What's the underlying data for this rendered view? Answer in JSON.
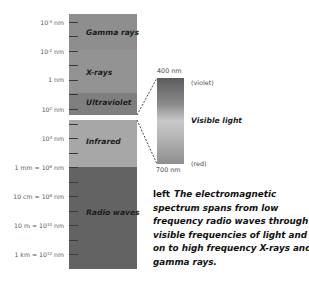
{
  "diagram": {
    "title": "Electromagnetic spectrum",
    "bands": [
      {
        "name": "Gamma rays",
        "color": "#8e8e8e"
      },
      {
        "name": "X-rays",
        "color": "#929292"
      },
      {
        "name": "Ultraviolet",
        "color": "#7e7e7e"
      },
      {
        "name": "Infrared",
        "color": "#a6a6a6"
      },
      {
        "name": "Radio waves",
        "color": "#626262"
      }
    ],
    "ticks": [
      {
        "base": "10",
        "exp": "-4",
        "unit": " nm",
        "prefix": ""
      },
      {
        "base": "10",
        "exp": "-2",
        "unit": " nm",
        "prefix": ""
      },
      {
        "base": "1",
        "exp": "",
        "unit": " nm",
        "prefix": ""
      },
      {
        "base": "10",
        "exp": "2",
        "unit": " nm",
        "prefix": ""
      },
      {
        "base": "10",
        "exp": "4",
        "unit": " nm",
        "prefix": ""
      },
      {
        "base": "10",
        "exp": "6",
        "unit": " nm",
        "prefix": "1 mm = "
      },
      {
        "base": "10",
        "exp": "8",
        "unit": " nm",
        "prefix": "10 cm = "
      },
      {
        "base": "10",
        "exp": "10",
        "unit": " nm",
        "prefix": "10 m = "
      },
      {
        "base": "10",
        "exp": "12",
        "unit": " nm",
        "prefix": "1 km = "
      }
    ],
    "visible_light": {
      "title": "Visible light",
      "top_wavelength": "400 nm",
      "top_color": "(violet)",
      "bottom_wavelength": "700 nm",
      "bottom_color": "(red)"
    }
  },
  "caption": {
    "lead": "left",
    "text": "The electromagnetic spectrum spans from low frequency radio waves through visible frequencies of light and on to high frequency X-rays and gamma rays."
  }
}
